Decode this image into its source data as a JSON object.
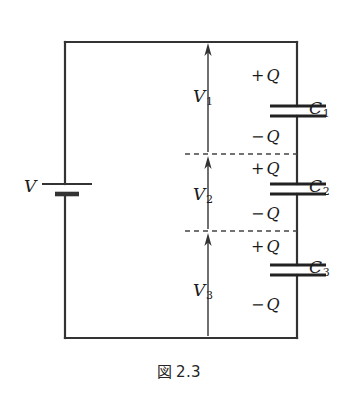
{
  "figure": {
    "caption_symbol": "図",
    "caption_number": "2.3",
    "type": "series-capacitor-circuit-diagram",
    "background_color": "#ffffff",
    "line_color": "#333333"
  },
  "source": {
    "label_text": "V",
    "name": "battery",
    "position": {
      "wire_x": 67,
      "plate_long_y": 184,
      "plate_short_y": 194
    },
    "label_position": {
      "x": 24,
      "y": 178
    }
  },
  "voltages": [
    {
      "id": "V1",
      "base": "V",
      "subscript": "1",
      "label_position": {
        "x": 193,
        "y": 88
      },
      "arrow": {
        "x": 208,
        "from_y": 152,
        "to_y": 44
      }
    },
    {
      "id": "V2",
      "base": "V",
      "subscript": "2",
      "label_position": {
        "x": 193,
        "y": 186
      },
      "arrow": {
        "x": 208,
        "from_y": 229,
        "to_y": 157
      }
    },
    {
      "id": "V3",
      "base": "V",
      "subscript": "3",
      "label_position": {
        "x": 193,
        "y": 282
      },
      "arrow": {
        "x": 208,
        "from_y": 336,
        "to_y": 234
      }
    }
  ],
  "capacitors": [
    {
      "id": "C1",
      "base": "C",
      "subscript": "1",
      "label_position": {
        "x": 309,
        "y": 100
      },
      "plate_top_y": 106,
      "plate_bottom_y": 116,
      "charge_top": {
        "sign": "+",
        "symbol": "Q",
        "x": 251,
        "y": 68
      },
      "charge_bottom": {
        "sign": "−",
        "symbol": "Q",
        "x": 251,
        "y": 129
      }
    },
    {
      "id": "C2",
      "base": "C",
      "subscript": "2",
      "label_position": {
        "x": 309,
        "y": 178
      },
      "plate_top_y": 184,
      "plate_bottom_y": 194,
      "charge_top": {
        "sign": "+",
        "symbol": "Q",
        "x": 251,
        "y": 161
      },
      "charge_bottom": {
        "sign": "−",
        "symbol": "Q",
        "x": 251,
        "y": 206
      }
    },
    {
      "id": "C3",
      "base": "C",
      "subscript": "3",
      "label_position": {
        "x": 309,
        "y": 259
      },
      "plate_top_y": 265,
      "plate_bottom_y": 275,
      "charge_top": {
        "sign": "+",
        "symbol": "Q",
        "x": 251,
        "y": 239
      },
      "charge_bottom": {
        "sign": "−",
        "symbol": "Q",
        "x": 251,
        "y": 297
      }
    }
  ],
  "node_lines": [
    {
      "id": "node-1",
      "y": 154,
      "x_from": 185,
      "x_to": 297,
      "style": "dashed"
    },
    {
      "id": "node-2",
      "y": 231,
      "x_from": 185,
      "x_to": 297,
      "style": "dashed"
    }
  ],
  "loop": {
    "left_x": 65,
    "right_x": 297,
    "top_y": 42,
    "bottom_y": 338
  }
}
